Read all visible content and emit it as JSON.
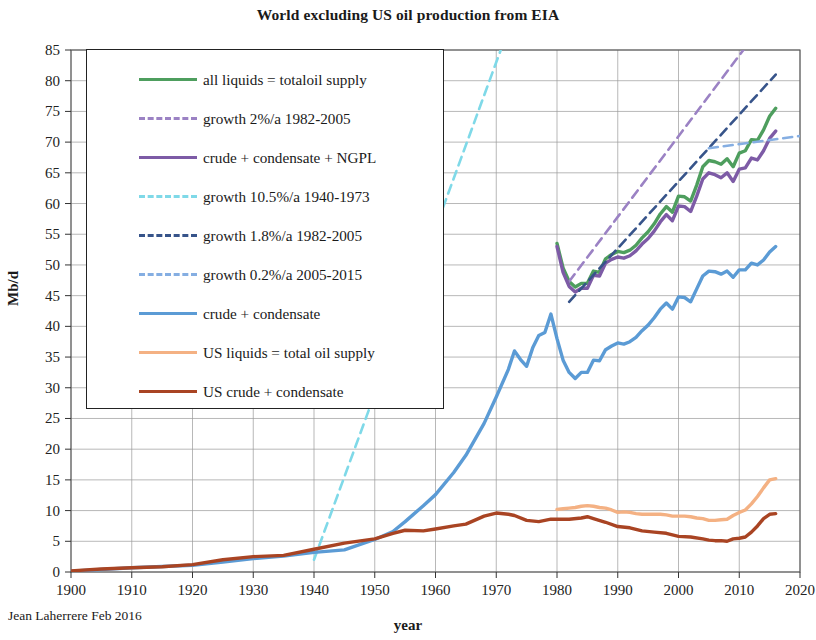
{
  "chart_data": {
    "type": "line",
    "title": "World excluding US oil production from EIA",
    "xlabel": "year",
    "ylabel": "Mb/d",
    "credit": "Jean Laherrere Feb 2016",
    "xlim": [
      1900,
      2020
    ],
    "ylim": [
      0,
      85
    ],
    "xticks": [
      1900,
      1910,
      1920,
      1930,
      1940,
      1950,
      1960,
      1970,
      1980,
      1990,
      2000,
      2010,
      2020
    ],
    "yticks": [
      0,
      5,
      10,
      15,
      20,
      25,
      30,
      35,
      40,
      45,
      50,
      55,
      60,
      65,
      70,
      75,
      80,
      85
    ],
    "grid": true,
    "legend_position": "upper-left-inside",
    "series": [
      {
        "name": "all liquids = totaloil supply",
        "color": "#4e9e5e",
        "style": "solid",
        "x": [
          1980,
          1981,
          1982,
          1983,
          1984,
          1985,
          1986,
          1987,
          1988,
          1989,
          1990,
          1991,
          1992,
          1993,
          1994,
          1995,
          1996,
          1997,
          1998,
          1999,
          2000,
          2001,
          2002,
          2003,
          2004,
          2005,
          2006,
          2007,
          2008,
          2009,
          2010,
          2011,
          2012,
          2013,
          2014,
          2015,
          2016
        ],
        "values": [
          53.5,
          49.5,
          47.3,
          46.4,
          47.0,
          47.0,
          49.0,
          48.8,
          51.0,
          51.7,
          52.2,
          52.0,
          52.4,
          53.2,
          54.4,
          55.4,
          56.7,
          58.3,
          59.5,
          58.6,
          61.2,
          61.1,
          60.4,
          63.0,
          66.0,
          67.0,
          66.8,
          66.4,
          67.3,
          66.0,
          68.2,
          68.6,
          70.4,
          70.3,
          72.0,
          74.2,
          75.5
        ]
      },
      {
        "name": "growth 2%/a 1982-2005",
        "color": "#9b82c4",
        "style": "dashed",
        "x": [
          1982,
          2016
        ],
        "values": [
          47.3,
          92.0
        ]
      },
      {
        "name": "crude + condensate + NGPL",
        "color": "#7d5ba6",
        "style": "solid",
        "x": [
          1980,
          1981,
          1982,
          1983,
          1984,
          1985,
          1986,
          1987,
          1988,
          1989,
          1990,
          1991,
          1992,
          1993,
          1994,
          1995,
          1996,
          1997,
          1998,
          1999,
          2000,
          2001,
          2002,
          2003,
          2004,
          2005,
          2006,
          2007,
          2008,
          2009,
          2010,
          2011,
          2012,
          2013,
          2014,
          2015,
          2016
        ],
        "values": [
          53.0,
          48.8,
          46.5,
          45.6,
          46.2,
          46.2,
          48.3,
          48.2,
          50.3,
          50.9,
          51.3,
          51.1,
          51.5,
          52.3,
          53.4,
          54.3,
          55.5,
          57.0,
          58.2,
          57.2,
          59.6,
          59.5,
          58.7,
          61.2,
          64.0,
          65.0,
          64.7,
          64.2,
          65.0,
          63.6,
          65.6,
          65.8,
          67.4,
          67.1,
          68.6,
          70.6,
          71.8
        ]
      },
      {
        "name": "growth 10.5%/a 1940-1973",
        "color": "#7fd9e8",
        "style": "dashed",
        "x": [
          1940,
          1980
        ],
        "values": [
          2.0,
          110.0
        ]
      },
      {
        "name": "growth 1.8%/a 1982-2005",
        "color": "#37548a",
        "style": "dashed",
        "x": [
          1982,
          2016
        ],
        "values": [
          44.0,
          81.0
        ]
      },
      {
        "name": "growth 0.2%/a 2005-2015",
        "color": "#85aee2",
        "style": "dashed",
        "x": [
          2005,
          2020
        ],
        "values": [
          69.0,
          71.0
        ]
      },
      {
        "name": "crude + condensate",
        "color": "#5b9bd5",
        "style": "solid",
        "x": [
          1900,
          1905,
          1910,
          1915,
          1920,
          1925,
          1930,
          1935,
          1940,
          1945,
          1950,
          1953,
          1955,
          1958,
          1960,
          1963,
          1965,
          1968,
          1970,
          1972,
          1973,
          1974,
          1975,
          1976,
          1977,
          1978,
          1979,
          1980,
          1981,
          1982,
          1983,
          1984,
          1985,
          1986,
          1987,
          1988,
          1989,
          1990,
          1991,
          1992,
          1993,
          1994,
          1995,
          1996,
          1997,
          1998,
          1999,
          2000,
          2001,
          2002,
          2003,
          2004,
          2005,
          2006,
          2007,
          2008,
          2009,
          2010,
          2011,
          2012,
          2013,
          2014,
          2015,
          2016
        ],
        "values": [
          0.15,
          0.4,
          0.7,
          0.9,
          1.1,
          1.6,
          2.2,
          2.6,
          3.2,
          3.6,
          5.3,
          6.6,
          8.2,
          10.8,
          12.6,
          16.2,
          19.0,
          24.2,
          28.5,
          33.0,
          36.0,
          34.6,
          33.5,
          36.5,
          38.5,
          39.0,
          42.0,
          38.0,
          34.5,
          32.5,
          31.5,
          32.5,
          32.5,
          34.5,
          34.4,
          36.2,
          36.8,
          37.3,
          37.1,
          37.5,
          38.2,
          39.3,
          40.2,
          41.4,
          42.8,
          43.8,
          42.8,
          44.8,
          44.7,
          44.0,
          46.1,
          48.2,
          49.0,
          48.9,
          48.5,
          49.0,
          48.0,
          49.2,
          49.2,
          50.3,
          50.0,
          50.8,
          52.1,
          53.0
        ]
      },
      {
        "name": "US liquids = total oil supply",
        "color": "#f4b183",
        "style": "solid",
        "x": [
          1980,
          1981,
          1982,
          1983,
          1984,
          1985,
          1986,
          1987,
          1988,
          1989,
          1990,
          1991,
          1992,
          1993,
          1994,
          1995,
          1996,
          1997,
          1998,
          1999,
          2000,
          2001,
          2002,
          2003,
          2004,
          2005,
          2006,
          2007,
          2008,
          2009,
          2010,
          2011,
          2012,
          2013,
          2014,
          2015,
          2016
        ],
        "values": [
          10.2,
          10.3,
          10.4,
          10.5,
          10.7,
          10.8,
          10.7,
          10.5,
          10.4,
          10.1,
          9.7,
          9.8,
          9.7,
          9.5,
          9.4,
          9.4,
          9.4,
          9.4,
          9.3,
          9.1,
          9.1,
          9.1,
          9.0,
          8.8,
          8.7,
          8.4,
          8.4,
          8.5,
          8.6,
          9.2,
          9.7,
          10.1,
          11.1,
          12.3,
          13.7,
          15.0,
          15.2
        ]
      },
      {
        "name": "US crude + condensate",
        "color": "#a94423",
        "style": "solid",
        "x": [
          1900,
          1905,
          1910,
          1915,
          1920,
          1925,
          1930,
          1935,
          1940,
          1945,
          1950,
          1953,
          1955,
          1958,
          1960,
          1963,
          1965,
          1968,
          1970,
          1972,
          1973,
          1975,
          1977,
          1979,
          1980,
          1982,
          1984,
          1985,
          1986,
          1988,
          1990,
          1992,
          1994,
          1996,
          1998,
          2000,
          2002,
          2004,
          2005,
          2006,
          2007,
          2008,
          2009,
          2010,
          2011,
          2012,
          2013,
          2014,
          2015,
          2016
        ],
        "values": [
          0.18,
          0.5,
          0.7,
          0.85,
          1.2,
          2.0,
          2.5,
          2.7,
          3.7,
          4.7,
          5.4,
          6.3,
          6.8,
          6.7,
          7.0,
          7.5,
          7.8,
          9.1,
          9.6,
          9.4,
          9.2,
          8.4,
          8.2,
          8.6,
          8.6,
          8.6,
          8.8,
          9.0,
          8.7,
          8.1,
          7.4,
          7.2,
          6.7,
          6.5,
          6.3,
          5.8,
          5.7,
          5.4,
          5.2,
          5.1,
          5.1,
          5.0,
          5.4,
          5.5,
          5.7,
          6.5,
          7.5,
          8.7,
          9.4,
          9.5
        ]
      }
    ]
  },
  "legend": {
    "items": [
      {
        "label": "all liquids = totaloil supply",
        "color": "#4e9e5e",
        "style": "solid"
      },
      {
        "label": "growth 2%/a 1982-2005",
        "color": "#9b82c4",
        "style": "dashed"
      },
      {
        "label": "crude + condensate + NGPL",
        "color": "#7d5ba6",
        "style": "solid"
      },
      {
        "label": "growth 10.5%/a 1940-1973",
        "color": "#7fd9e8",
        "style": "dashed"
      },
      {
        "label": "growth 1.8%/a 1982-2005",
        "color": "#37548a",
        "style": "dashed"
      },
      {
        "label": "growth 0.2%/a 2005-2015",
        "color": "#85aee2",
        "style": "dashed"
      },
      {
        "label": "crude + condensate",
        "color": "#5b9bd5",
        "style": "solid"
      },
      {
        "label": "US liquids = total oil supply",
        "color": "#f4b183",
        "style": "solid"
      },
      {
        "label": "US crude + condensate",
        "color": "#a94423",
        "style": "solid"
      }
    ]
  },
  "axes": {
    "plot_left": 71,
    "plot_right": 800,
    "plot_top": 50,
    "plot_bottom": 572
  }
}
